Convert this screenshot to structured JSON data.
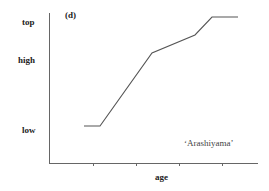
{
  "chart_data": {
    "type": "line",
    "panel_label": "(d)",
    "title": "",
    "xlabel": "age",
    "ylabel": "",
    "y_tick_labels": [
      "low",
      "high",
      "top"
    ],
    "annotation": "‘Arashiyama’",
    "x_ticks_count": 4,
    "series": [
      {
        "name": "Arashiyama",
        "points_px": [
          [
            84,
            126
          ],
          [
            100,
            126
          ],
          [
            152,
            53
          ],
          [
            195,
            35
          ],
          [
            212,
            17
          ],
          [
            238,
            17
          ]
        ],
        "points_relative": [
          [
            0.17,
            0.25
          ],
          [
            0.25,
            0.25
          ],
          [
            0.5,
            0.74
          ],
          [
            0.71,
            0.86
          ],
          [
            0.79,
            0.98
          ],
          [
            0.91,
            0.98
          ]
        ]
      }
    ],
    "colors": {
      "axis": "#555555",
      "line": "#555555"
    }
  }
}
